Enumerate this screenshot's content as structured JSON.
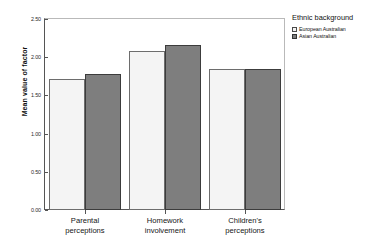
{
  "chart_data": {
    "type": "bar",
    "title": "",
    "xlabel": "",
    "ylabel": "Mean value of factor",
    "ylim": [
      0.0,
      2.5
    ],
    "yticks": [
      "0.00",
      "0.50",
      "1.00",
      "1.50",
      "2.00",
      "2.50"
    ],
    "ytick_values": [
      0.0,
      0.5,
      1.0,
      1.5,
      2.0,
      2.5
    ],
    "grid": false,
    "legend_position": "right",
    "legend_title": "Ethnic background",
    "categories": [
      {
        "line1": "Parental",
        "line2": "perceptions"
      },
      {
        "line1": "Homework",
        "line2": "involvement"
      },
      {
        "line1": "Children's",
        "line2": "perceptions"
      }
    ],
    "series": [
      {
        "name": "European Australian",
        "color": "#f4f4f4",
        "values": [
          1.72,
          2.08,
          1.84
        ]
      },
      {
        "name": "Asian Australian",
        "color": "#7e7e7e",
        "values": [
          1.78,
          2.16,
          1.85
        ]
      }
    ]
  }
}
